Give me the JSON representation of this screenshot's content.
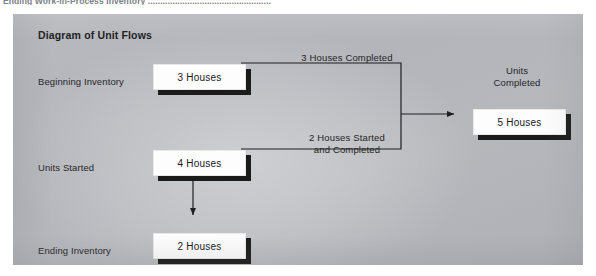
{
  "page": {
    "cutoff_caption": "Ending Work-in-Process Inventory .................................................."
  },
  "panel": {
    "title": "Diagram of Unit Flows",
    "background_color": "#b5b7bc",
    "box_fill_color": "#fdfdfd",
    "box_shadow_color": "#1b1b1b",
    "line_color": "#1f1f23"
  },
  "rows": [
    {
      "label": "Beginning Inventory",
      "value": "3 Houses",
      "label_left": 25,
      "label_top": 62,
      "box_left": 140,
      "box_top": 50,
      "box_width": 93,
      "box_height": 26
    },
    {
      "label": "Units Started",
      "value": "4 Houses",
      "label_left": 25,
      "label_top": 148,
      "box_left": 140,
      "box_top": 136,
      "box_width": 93,
      "box_height": 26
    },
    {
      "label": "Ending Inventory",
      "value": "2 Houses",
      "label_left": 25,
      "label_top": 231,
      "box_left": 140,
      "box_top": 219,
      "box_width": 93,
      "box_height": 26
    }
  ],
  "result": {
    "caption": "Units\nCompleted",
    "caption_left": 464,
    "caption_top": 51,
    "caption_width": 80,
    "value": "5 Houses",
    "box_left": 460,
    "box_top": 95,
    "box_width": 93,
    "box_height": 26
  },
  "flow_labels": [
    {
      "text": "3 Houses Completed",
      "left": 249,
      "top": 38,
      "width": 170
    },
    {
      "text": "2 Houses Started\nand Completed",
      "left": 249,
      "top": 118,
      "width": 170
    }
  ],
  "connectors": {
    "top_merge_path": "M 228 49 L 388 49 L 388 100",
    "bottom_merge_path": "M 228 135 L 388 135 L 388 100",
    "arrow_to_result_path": "M 388 100 L 440 100",
    "arrow_down_path": "M 180 148 L 180 200",
    "stroke_width": 1.2
  }
}
